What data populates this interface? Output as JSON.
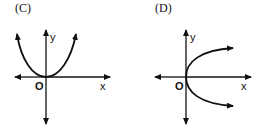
{
  "panels": [
    {
      "id": "C",
      "label": "(C)",
      "x_label": "x",
      "y_label": "y",
      "origin_label": "O",
      "curve": "upward parabola y = x^2 with vertex at origin"
    },
    {
      "id": "D",
      "label": "(D)",
      "x_label": "x",
      "y_label": "y",
      "origin_label": "O",
      "curve": "rightward parabola x = y^2 with vertex at origin"
    }
  ],
  "colors": {
    "ink": "#111111",
    "background": "#ffffff"
  }
}
